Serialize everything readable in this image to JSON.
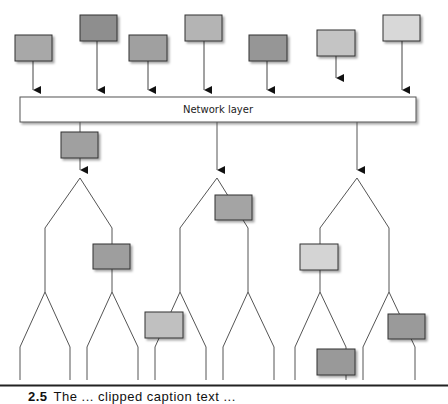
{
  "diagram": {
    "network_layer": {
      "label": "Network layer"
    },
    "colors": {
      "line": "#555555",
      "box_border": "#333333",
      "shadow": "#d0d0d0",
      "network_fill": "#ffffff"
    },
    "top_boxes": [
      {
        "id": "src-1",
        "x": 15,
        "y": 35,
        "w": 37,
        "h": 26,
        "fill": "#a8a8a8",
        "line_x": 33,
        "arrow_y": 90
      },
      {
        "id": "src-2",
        "x": 80,
        "y": 15,
        "w": 37,
        "h": 26,
        "fill": "#8e8e8e",
        "line_x": 97,
        "arrow_y": 90
      },
      {
        "id": "src-3",
        "x": 129,
        "y": 35,
        "w": 38,
        "h": 26,
        "fill": "#a0a0a0",
        "line_x": 148,
        "arrow_y": 90
      },
      {
        "id": "src-4",
        "x": 185,
        "y": 15,
        "w": 37,
        "h": 26,
        "fill": "#b4b4b4",
        "line_x": 204,
        "arrow_y": 90
      },
      {
        "id": "src-5",
        "x": 249,
        "y": 35,
        "w": 38,
        "h": 26,
        "fill": "#969696",
        "line_x": 267,
        "arrow_y": 90
      },
      {
        "id": "src-6",
        "x": 317,
        "y": 30,
        "w": 38,
        "h": 26,
        "fill": "#c4c4c4",
        "line_x": 336,
        "arrow_y": 78
      },
      {
        "id": "src-7",
        "x": 383,
        "y": 15,
        "w": 37,
        "h": 26,
        "fill": "#d8d8d8",
        "line_x": 402,
        "arrow_y": 90
      }
    ],
    "trees": [
      {
        "id": "tree-left",
        "root_x": 80,
        "has_box_on_stem": true,
        "stem_box": {
          "x": 61,
          "y": 132,
          "w": 37,
          "h": 26,
          "fill": "#a0a0a0"
        }
      },
      {
        "id": "tree-middle",
        "root_x": 217,
        "has_box_on_stem": false
      },
      {
        "id": "tree-right",
        "root_x": 357,
        "has_box_on_stem": false
      }
    ],
    "tree_boxes": [
      {
        "id": "node-a",
        "x": 93,
        "y": 244,
        "w": 37,
        "h": 25,
        "fill": "#9e9e9e"
      },
      {
        "id": "node-b",
        "x": 215,
        "y": 195,
        "w": 37,
        "h": 25,
        "fill": "#a4a4a4"
      },
      {
        "id": "node-c",
        "x": 145,
        "y": 312,
        "w": 38,
        "h": 26,
        "fill": "#c0c0c0"
      },
      {
        "id": "node-d",
        "x": 300,
        "y": 244,
        "w": 38,
        "h": 26,
        "fill": "#d4d4d4"
      },
      {
        "id": "node-e",
        "x": 388,
        "y": 314,
        "w": 37,
        "h": 25,
        "fill": "#9a9a9a"
      },
      {
        "id": "node-f",
        "x": 317,
        "y": 349,
        "w": 38,
        "h": 26,
        "fill": "#999999"
      }
    ]
  },
  "caption": {
    "number": "2.5",
    "text": "The ... clipped caption text ..."
  }
}
